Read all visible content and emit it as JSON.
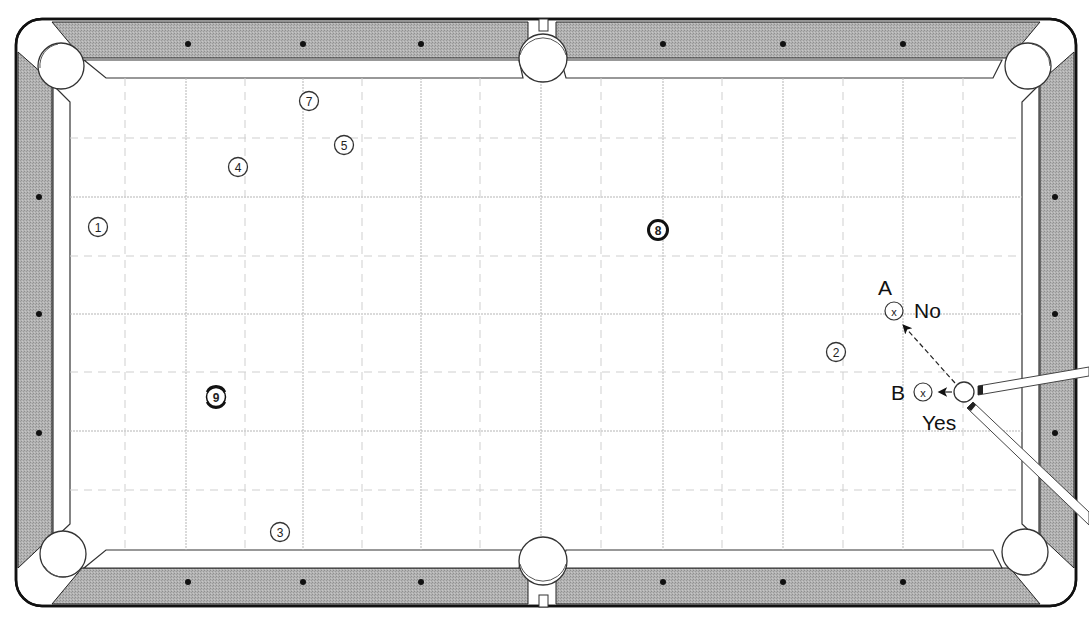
{
  "diagram": {
    "type": "pool-table-shot-diagram",
    "colors": {
      "rail": "#a9a9a9",
      "frame": "#111111",
      "cloth": "#ffffff",
      "grid": "#b8b8b8",
      "diamond": "#111111"
    },
    "balls": [
      {
        "number": "1",
        "label": "①",
        "x": 98,
        "y": 227,
        "style": "outline"
      },
      {
        "number": "2",
        "label": "②",
        "x": 836,
        "y": 352,
        "style": "outline"
      },
      {
        "number": "3",
        "label": "③",
        "x": 280,
        "y": 532,
        "style": "outline"
      },
      {
        "number": "4",
        "label": "④",
        "x": 238,
        "y": 167,
        "style": "outline"
      },
      {
        "number": "5",
        "label": "⑤",
        "x": 344,
        "y": 145,
        "style": "outline"
      },
      {
        "number": "7",
        "label": "⑦",
        "x": 309,
        "y": 101,
        "style": "outline"
      },
      {
        "number": "8",
        "label": "⑧",
        "x": 658,
        "y": 230,
        "style": "solid-ring"
      },
      {
        "number": "9",
        "label": "⑨",
        "x": 216,
        "y": 397,
        "style": "striped-ring"
      }
    ],
    "cue_ball": {
      "x": 964,
      "y": 392
    },
    "targets": [
      {
        "id": "A",
        "label": "A",
        "x": 894,
        "y": 311,
        "verdict": "No",
        "path": "dashed"
      },
      {
        "id": "B",
        "label": "B",
        "x": 925,
        "y": 392,
        "verdict": "Yes",
        "path": "solid"
      }
    ],
    "annotations": {
      "a_letter": "A",
      "a_verdict": "No",
      "b_letter": "B",
      "b_verdict": "Yes"
    },
    "diamonds": {
      "top_x": [
        188,
        303,
        421,
        663,
        783,
        903
      ],
      "left_y": [
        197,
        314,
        433
      ]
    }
  }
}
